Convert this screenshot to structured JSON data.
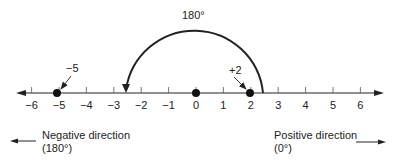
{
  "diagram": {
    "title_angle": "180°",
    "number_line": {
      "min": -6,
      "max": 6,
      "ticks": [
        "−6",
        "−5",
        "−4",
        "−3",
        "−2",
        "−1",
        "0",
        "1",
        "2",
        "3",
        "4",
        "5",
        "6"
      ]
    },
    "points": [
      {
        "value": -5,
        "label": "−5"
      },
      {
        "value": 0,
        "label": ""
      },
      {
        "value": 2,
        "label": "+2"
      }
    ],
    "rotation_arc": {
      "from": 2.5,
      "to": -2.5,
      "label": "180°"
    },
    "negative_direction": {
      "label": "Negative direction",
      "angle": "(180°)"
    },
    "positive_direction": {
      "label": "Positive direction",
      "angle": "(0°)"
    },
    "colors": {
      "ink": "#222222",
      "background": "#ffffff"
    }
  }
}
